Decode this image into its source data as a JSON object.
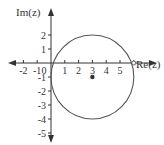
{
  "diagram": {
    "type": "complex-plane",
    "axes": {
      "x_label": "Re(z)",
      "y_label": "Im(z)",
      "x_ticks": [
        "-2",
        "-1",
        "0",
        "1",
        "2",
        "3",
        "4",
        "5",
        "6"
      ],
      "x_tick_values": [
        -2,
        -1,
        0,
        1,
        2,
        3,
        4,
        5,
        6
      ],
      "y_ticks": [
        "2",
        "1",
        "-1",
        "-2",
        "-3",
        "-4",
        "-5"
      ],
      "y_tick_values": [
        2,
        1,
        -1,
        -2,
        -3,
        -4,
        -5
      ],
      "x_range": [
        -3,
        7.5
      ],
      "y_range": [
        -5.8,
        3.5
      ]
    },
    "circle": {
      "center": [
        3,
        -1
      ],
      "radius": 3,
      "stroke": "#555555"
    },
    "points": [
      {
        "name": "center",
        "x": 3,
        "y": -1,
        "style": "filled"
      },
      {
        "name": "re-intercept",
        "x": 6,
        "y": 0,
        "style": "open"
      }
    ],
    "colors": {
      "axis": "#333333",
      "circle": "#555555",
      "text": "#333333"
    }
  }
}
